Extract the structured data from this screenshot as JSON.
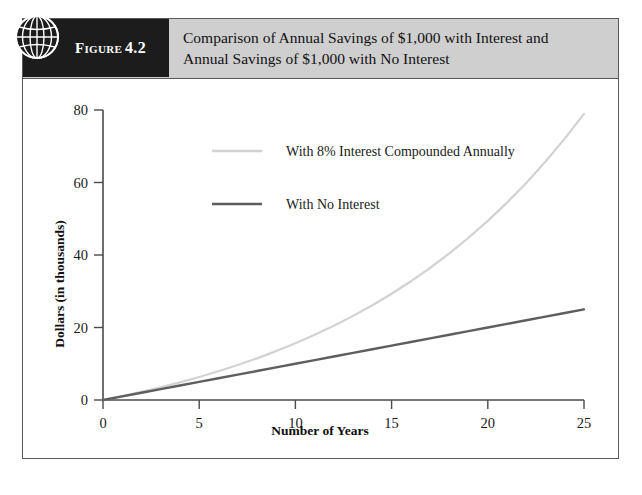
{
  "figure": {
    "tab_word": "Figure",
    "tab_number": "4.2",
    "icon": "globe-icon",
    "title_line1": "Comparison of Annual Savings of $1,000 with Interest and",
    "title_line2": "Annual Savings of $1,000 with No Interest"
  },
  "colors": {
    "tab_background": "#1c1c1c",
    "header_background": "#cfcfcf",
    "frame_border": "#5a5a5a",
    "series_interest": "#d2d2d2",
    "series_no_interest": "#5e5e5e"
  },
  "chart_data": {
    "type": "line",
    "title": "Comparison of Annual Savings of $1,000 with Interest and Annual Savings of $1,000 with No Interest",
    "xlabel": "Number of Years",
    "ylabel": "Dollars (in thousands)",
    "xlim": [
      0,
      25
    ],
    "ylim": [
      0,
      80
    ],
    "xticks": [
      0,
      5,
      10,
      15,
      20,
      25
    ],
    "yticks": [
      0,
      20,
      40,
      60,
      80
    ],
    "xtick_labels": [
      "0",
      "5",
      "10",
      "15",
      "20",
      "25"
    ],
    "ytick_labels": [
      "0",
      "20",
      "40",
      "60",
      "80"
    ],
    "grid": false,
    "legend_position": "upper-center-inside",
    "x": [
      0,
      1,
      2,
      3,
      4,
      5,
      6,
      7,
      8,
      9,
      10,
      11,
      12,
      13,
      14,
      15,
      16,
      17,
      18,
      19,
      20,
      21,
      22,
      23,
      24,
      25
    ],
    "series": [
      {
        "name": "With 8% Interest Compounded Annually",
        "color": "#d2d2d2",
        "values": [
          0,
          1.08,
          2.25,
          3.51,
          4.87,
          6.34,
          7.92,
          9.64,
          11.49,
          13.49,
          15.65,
          17.98,
          20.5,
          23.21,
          26.15,
          29.32,
          32.75,
          36.45,
          40.45,
          44.76,
          49.42,
          54.46,
          59.89,
          65.77,
          72.11,
          78.95
        ]
      },
      {
        "name": "With No Interest",
        "color": "#5e5e5e",
        "values": [
          0,
          1,
          2,
          3,
          4,
          5,
          6,
          7,
          8,
          9,
          10,
          11,
          12,
          13,
          14,
          15,
          16,
          17,
          18,
          19,
          20,
          21,
          22,
          23,
          24,
          25
        ]
      }
    ]
  }
}
